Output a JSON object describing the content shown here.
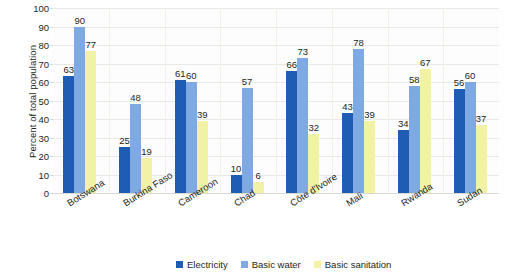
{
  "chart_data": {
    "type": "bar",
    "title": "",
    "subtitle": "",
    "xlabel": "",
    "ylabel": "Percent of total population",
    "ylim": [
      0,
      100
    ],
    "ytick_step": 10,
    "yticks": [
      0,
      10,
      20,
      30,
      40,
      50,
      60,
      70,
      80,
      90,
      100
    ],
    "grid": true,
    "grid_axis": "y",
    "legend_position": "bottom-center",
    "orientation": "vertical",
    "grouping": "grouped",
    "categories": [
      "Botswana",
      "Burkina Faso",
      "Cameroon",
      "Chad",
      "Côte d'Ivoire",
      "Mali",
      "Rwanda",
      "Sudan"
    ],
    "series": [
      {
        "name": "Electricity",
        "color": "#1f5cb4",
        "values": [
          63,
          25,
          61,
          10,
          66,
          43,
          34,
          56
        ]
      },
      {
        "name": "Basic water",
        "color": "#7fa9e2",
        "values": [
          90,
          48,
          60,
          57,
          73,
          78,
          58,
          60
        ]
      },
      {
        "name": "Basic sanitation",
        "color": "#f1f2a6",
        "values": [
          77,
          19,
          39,
          6,
          32,
          39,
          67,
          37
        ]
      }
    ],
    "data_labels": {
      "show": true,
      "Botswana": {
        "Electricity": "63",
        "Basic water": "90",
        "Basic sanitation": "77"
      },
      "Burkina Faso": {
        "Electricity": "25",
        "Basic water": "48",
        "Basic sanitation": "19"
      },
      "Cameroon": {
        "Electricity": "61",
        "Basic water": "60",
        "Basic sanitation": "39"
      },
      "Chad": {
        "Electricity": "10",
        "Basic water": "57",
        "Basic sanitation": "6"
      },
      "Côte d'Ivoire": {
        "Electricity": "66",
        "Basic water": "73",
        "Basic sanitation": "32"
      },
      "Mali": {
        "Electricity": "43",
        "Basic water": "78",
        "Basic sanitation": "39"
      },
      "Rwanda": {
        "Electricity": "34",
        "Basic water": "58",
        "Basic sanitation": "67"
      },
      "Sudan": {
        "Electricity": "56",
        "Basic water": "60",
        "Basic sanitation": "37"
      }
    }
  },
  "axis": {
    "y_title": "Percent of total population"
  },
  "legend": {
    "items": [
      {
        "label": "Electricity",
        "color": "#1f5cb4"
      },
      {
        "label": "Basic water",
        "color": "#7fa9e2"
      },
      {
        "label": "Basic sanitation",
        "color": "#f1f2a6"
      }
    ]
  },
  "colors": {
    "electricity": "#1f5cb4",
    "basic_water": "#7fa9e2",
    "basic_sanitation": "#f1f2a6",
    "text": "#231f20",
    "gridline": "#e9e9e4",
    "background": "#ffffff"
  }
}
